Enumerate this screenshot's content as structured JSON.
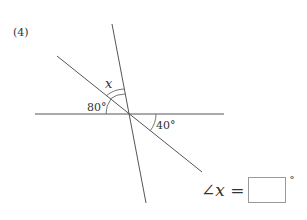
{
  "problem": {
    "number": "(4)",
    "angle_labels": {
      "x": "x",
      "a80": "80°",
      "a40": "40°"
    },
    "answer": {
      "expression": "∠x =",
      "box_value": "",
      "degree_symbol": "°"
    }
  }
}
